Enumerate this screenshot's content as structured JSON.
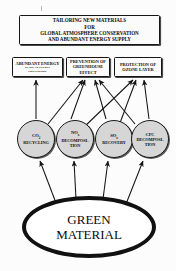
{
  "diagram": {
    "title_box": {
      "lines": [
        "TAILORING NEW MATERIALS",
        "FOR",
        "GLOBAL ATMOSPHERE CONSERVATION",
        "AND ABUNDANT ENERGY SUPPLY"
      ]
    },
    "outcome_boxes": [
      {
        "id": "abundant-energy",
        "lines": [
          "ABUNDANT ENERGY"
        ],
        "sub_lines": [
          "BY SOLAR ENERGY",
          "CONVERSION"
        ]
      },
      {
        "id": "greenhouse",
        "lines": [
          "PREVENTION OF",
          "GREENHOUSE",
          "EFFECT"
        ],
        "sub_lines": []
      },
      {
        "id": "ozone",
        "lines": [
          "PROTECTION OF",
          "OZONE LAYER"
        ],
        "sub_lines": []
      }
    ],
    "process_circles": [
      {
        "id": "co2",
        "top_line": "CO",
        "subscript": "2",
        "rest_lines": [
          "RECYCLING"
        ]
      },
      {
        "id": "nox",
        "top_line": "NO",
        "subscript": "x",
        "rest_lines": [
          "DECOMPOSI-",
          "TION"
        ]
      },
      {
        "id": "sox",
        "top_line": "SO",
        "subscript": "x",
        "rest_lines": [
          "RECOVERY"
        ]
      },
      {
        "id": "cfc",
        "top_line": "CFC",
        "subscript": "",
        "rest_lines": [
          "DECOMPOSI-",
          "TION"
        ]
      }
    ],
    "root_node": {
      "lines": [
        "GREEN",
        "MATERIAL"
      ]
    },
    "colors": {
      "background": "#fcfcfc",
      "line": "#141414",
      "circle_fill": "#d6d6d6",
      "box_fill": "#fbfbfb",
      "text": "#0d0d0d"
    },
    "edges": [
      {
        "from": "green-material",
        "to": "co2"
      },
      {
        "from": "green-material",
        "to": "nox"
      },
      {
        "from": "green-material",
        "to": "sox"
      },
      {
        "from": "green-material",
        "to": "cfc"
      },
      {
        "from": "co2",
        "to": "abundant-energy"
      },
      {
        "from": "co2",
        "to": "greenhouse"
      },
      {
        "from": "nox",
        "to": "greenhouse"
      },
      {
        "from": "nox",
        "to": "ozone"
      },
      {
        "from": "sox",
        "to": "greenhouse"
      },
      {
        "from": "sox",
        "to": "ozone"
      },
      {
        "from": "cfc",
        "to": "greenhouse"
      },
      {
        "from": "cfc",
        "to": "ozone"
      }
    ]
  }
}
